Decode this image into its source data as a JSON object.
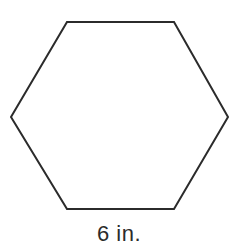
{
  "figure": {
    "name": "regular-hexagon",
    "shape_type": "hexagon",
    "sides": 6,
    "orientation": "flat-top",
    "fill_color": "#ffffff",
    "stroke_color": "#2b2b2b",
    "stroke_width": 2,
    "background_color": "#ffffff",
    "vertices": [
      {
        "label": "top-left",
        "x": 67,
        "y": 22
      },
      {
        "label": "top-right",
        "x": 174,
        "y": 22
      },
      {
        "label": "right",
        "x": 228,
        "y": 117
      },
      {
        "label": "bottom-right",
        "x": 174,
        "y": 209
      },
      {
        "label": "bottom-left",
        "x": 67,
        "y": 209
      },
      {
        "label": "left",
        "x": 11,
        "y": 117
      }
    ],
    "points_attr": "67,22 174,22 228,117 174,209 67,209 11,117"
  },
  "labels": {
    "bottom_side": {
      "text": "6 in.",
      "value": "6",
      "unit": "in.",
      "x": 119,
      "y": 241,
      "anchor": "middle",
      "color": "#2b2b2b",
      "describes": "bottom-side-length"
    }
  }
}
